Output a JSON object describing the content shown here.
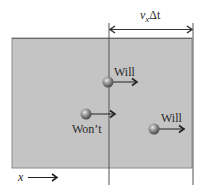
{
  "diagram": {
    "region": {
      "fill": "#c4c4c4",
      "border": "#7a7a7a"
    },
    "interval": {
      "symbol_v": "v",
      "subscript": "x",
      "symbol_delta_t": "Δt"
    },
    "particles": [
      {
        "label": "Will",
        "status": "will cross"
      },
      {
        "label": "Won’t",
        "status": "won't cross"
      },
      {
        "label": "Will",
        "status": "will cross"
      }
    ],
    "axis": {
      "label": "x"
    }
  }
}
